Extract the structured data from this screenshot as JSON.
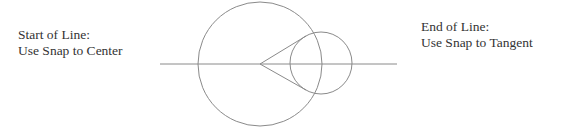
{
  "labels": {
    "start": {
      "line1": "Start of Line:",
      "line2": "Use Snap to Center"
    },
    "end": {
      "line1": "End of Line:",
      "line2": "Use Snap to Tangent"
    }
  },
  "geometry": {
    "stroke_color": "#8a8a8a",
    "axis_line": {
      "x1": 160,
      "y1": 64,
      "x2": 397,
      "y2": 64
    },
    "large_circle": {
      "cx": 260,
      "cy": 64,
      "r": 62
    },
    "small_circle": {
      "cx": 321,
      "cy": 63,
      "r": 31
    },
    "tangent_lines": [
      {
        "x1": 260,
        "y1": 64,
        "x2": 306,
        "y2": 36
      },
      {
        "x1": 260,
        "y1": 64,
        "x2": 306,
        "y2": 90
      }
    ]
  }
}
